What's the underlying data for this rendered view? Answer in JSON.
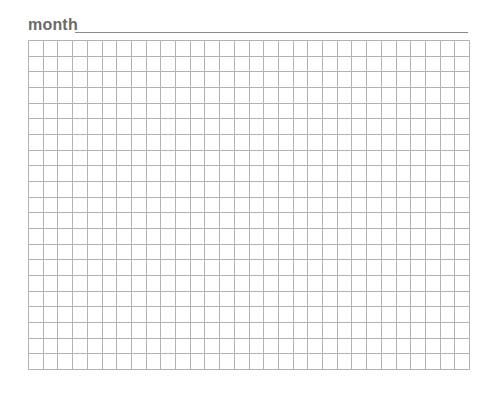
{
  "header": {
    "label": "month",
    "field_value": ""
  },
  "grid": {
    "columns": 30,
    "rows": 21,
    "line_color": "#b3b3b3"
  },
  "colors": {
    "label": "#6a6a6a",
    "underline": "#8a8a8a",
    "background": "#ffffff"
  }
}
